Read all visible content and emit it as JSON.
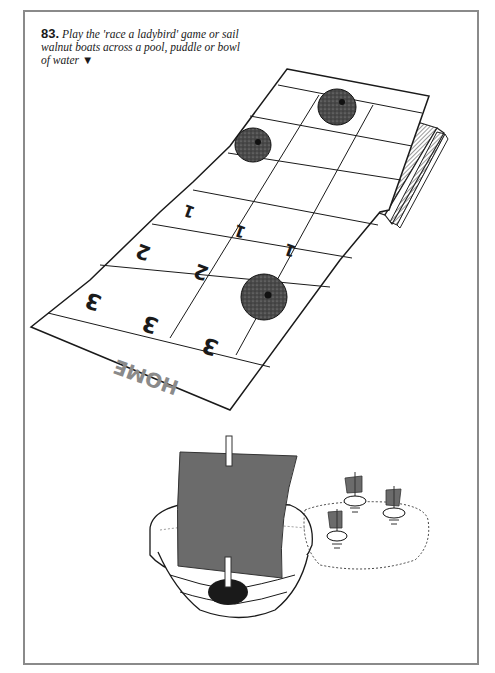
{
  "caption": {
    "number": "83.",
    "text": " Play the 'race a ladybird' game or sail walnut boats across a pool, puddle or bowl of water ",
    "arrow": "▼"
  },
  "board": {
    "home_label": "HOME",
    "row_scores": [
      {
        "value": "1",
        "cells": [
          "1",
          "1",
          "1"
        ]
      },
      {
        "value": "2",
        "cells": [
          "2",
          "2"
        ]
      },
      {
        "value": "3",
        "cells": [
          "3",
          "3",
          "3"
        ]
      }
    ],
    "ladybirds": 3,
    "supports": "books"
  },
  "boats": {
    "large": "walnut-shell boat with paper sail",
    "small_count": 3,
    "pool": "dotted puddle"
  },
  "colors": {
    "frame": "#8a8a8a",
    "ink": "#1a1a1a",
    "sail": "#6b6b6b",
    "ladybird": "#3a3a3a"
  }
}
